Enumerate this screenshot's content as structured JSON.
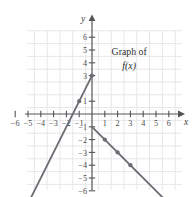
{
  "chart_data": {
    "type": "line",
    "title": "",
    "annotations": [
      {
        "text": "Graph of",
        "x": 2.9,
        "y": 4.6,
        "style": "normal"
      },
      {
        "text": "f(x)",
        "x": 2.9,
        "y": 3.5,
        "style": "italic"
      }
    ],
    "xlabel": "x",
    "ylabel": "y",
    "xlim": [
      -6.9,
      6.9
    ],
    "ylim": [
      -7.2,
      7.2
    ],
    "grid": true,
    "legend": "none",
    "xticks": [
      -6,
      -5,
      -4,
      -3,
      -2,
      -1,
      1,
      2,
      3,
      4,
      5,
      6
    ],
    "xtick_labels": [
      "−6",
      "−5",
      "−4",
      "−3",
      "−2",
      "−1",
      "1",
      "2",
      "3",
      "4",
      "5",
      "6"
    ],
    "yticks": [
      6,
      5,
      4,
      3,
      1,
      -1,
      -2,
      -3,
      -4,
      -5,
      -6
    ],
    "ytick_labels": [
      "6",
      "5",
      "4",
      "3",
      "1",
      "−1",
      "−2",
      "−3",
      "−4",
      "−5",
      "−6"
    ],
    "series": [
      {
        "name": "left-branch",
        "slope": 2,
        "intercept": 3,
        "x": [
          -5.0,
          0.0
        ],
        "y": [
          -7.0,
          3.0
        ],
        "markers": [
          {
            "x": -1,
            "y": 1
          },
          {
            "x": 0,
            "y": 3
          }
        ],
        "color": "#6b6b73"
      },
      {
        "name": "right-branch",
        "slope": -1,
        "intercept": -1,
        "x": [
          0.0,
          6.0
        ],
        "y": [
          -1.0,
          -7.0
        ],
        "markers": [
          {
            "x": 1,
            "y": -2
          },
          {
            "x": 2,
            "y": -3
          },
          {
            "x": 3,
            "y": -4
          }
        ],
        "color": "#6b6b73"
      }
    ],
    "colors": {
      "curve": "#6b6b73",
      "axis": "#555558",
      "grid": "#e4e4e8",
      "tick_label": "#4d4d4d",
      "annotation": "#2b2b2b",
      "background": "#ffffff"
    }
  }
}
